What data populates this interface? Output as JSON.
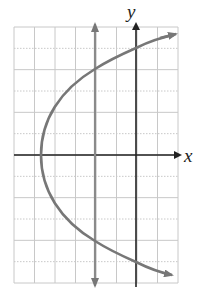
{
  "chart_data": {
    "type": "line",
    "title": "",
    "xlabel": "x",
    "ylabel": "y",
    "grid": true,
    "xlim": [
      -6,
      2
    ],
    "ylim": [
      -6,
      6
    ],
    "grid_step": 1,
    "series": [
      {
        "name": "sideways parabola (opens right)",
        "color": "#777777",
        "points": [
          [
            2,
            5.6
          ],
          [
            0,
            5
          ],
          [
            -2,
            4
          ],
          [
            -3.5,
            2.5
          ],
          [
            -4.6,
            0
          ],
          [
            -3.5,
            -2.5
          ],
          [
            -2,
            -4
          ],
          [
            0,
            -5
          ],
          [
            2,
            -5.6
          ]
        ]
      },
      {
        "name": "vertical line x = -2",
        "color": "#888888",
        "points": [
          [
            -2,
            -6.2
          ],
          [
            -2,
            6.2
          ]
        ]
      }
    ],
    "annotations": [
      "arrow heads on both ends of parabola",
      "arrow heads on both ends of vertical line x = -2"
    ]
  },
  "axes": {
    "x_label": "x",
    "y_label": "y"
  },
  "colors": {
    "grid": "#c8c8c8",
    "axis": "#222222",
    "curve": "#777777",
    "line": "#8a8a8a"
  }
}
